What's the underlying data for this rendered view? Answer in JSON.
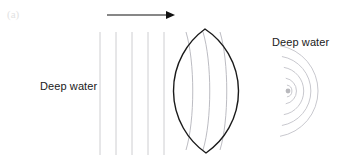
{
  "figure": {
    "panel_label": "(a)",
    "width": 345,
    "height": 163,
    "background_color": "#ffffff",
    "labels": {
      "deep_water_left": "Deep water",
      "deep_water_right": "Deep water"
    },
    "colors": {
      "lens_outline": "#1a1a1a",
      "wavefront_plane": "#c8c8cc",
      "wavefront_inside": "#b4b4bb",
      "wavefront_converging": "#c2c2c8",
      "focal_point": "#b9b9bd",
      "arrow": "#111111",
      "text": "#1a1a1a",
      "panel_label": "#e2e2e2"
    },
    "direction_arrow": {
      "name": "wave-direction-arrow",
      "x1": 107,
      "y1": 15,
      "x2": 175,
      "y2": 15,
      "head_length": 9,
      "head_half_width": 4
    },
    "incoming_plane_wavefronts": {
      "count": 5,
      "x_positions": [
        100,
        116,
        132,
        148,
        164
      ],
      "y_top": 32,
      "y_bottom": 155
    },
    "lens": {
      "name": "shallow-water-lens",
      "left_x": 173,
      "right_x": 238,
      "top_x": 205,
      "top_y": 29,
      "bottom_x": 206,
      "bottom_y": 153,
      "center_y": 91,
      "stroke_width": 1.4
    },
    "lens_interior_wavefronts": {
      "count": 3,
      "apex_x": [
        186,
        203,
        220
      ],
      "bulge": [
        9,
        9,
        9
      ]
    },
    "converging_wavefronts": {
      "count": 5,
      "focus_x": 288,
      "focus_y": 91,
      "radii": [
        46,
        35,
        24,
        13,
        6
      ],
      "sweep_degrees": 160
    },
    "focal_point": {
      "name": "focal-point",
      "x": 288,
      "y": 91,
      "radius": 2.4
    }
  }
}
